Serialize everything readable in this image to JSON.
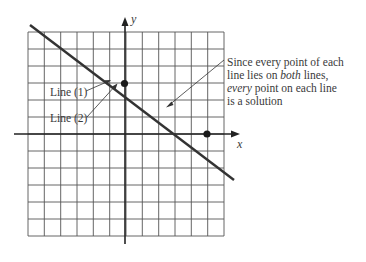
{
  "figure": {
    "type": "coordinate-plane",
    "axes": {
      "x_label": "x",
      "y_label": "y"
    },
    "grid": {
      "columns": 12,
      "rows": 12
    },
    "line_labels": {
      "line1": "Line (1)",
      "line2": "Line (2)"
    },
    "annotation": {
      "line1_a": "Since every point of each",
      "line2_a": "line lies on ",
      "line2_em": "both",
      "line2_b": " lines,",
      "line3_em": "every",
      "line3_b": " point on each line",
      "line4": "is a solution"
    },
    "colors": {
      "grid": "#555555",
      "axis": "#222222",
      "line": "#333333",
      "text": "#3a3a3a"
    }
  }
}
